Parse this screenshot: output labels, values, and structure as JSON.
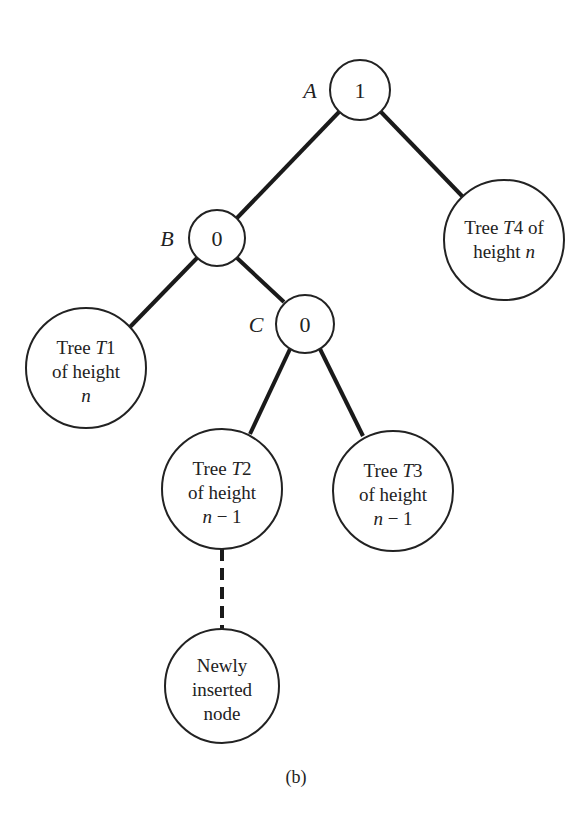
{
  "diagram": {
    "caption": "(b)",
    "nodes": {
      "A": {
        "label": "A",
        "balance": "1"
      },
      "B": {
        "label": "B",
        "balance": "0"
      },
      "C": {
        "label": "C",
        "balance": "0"
      }
    },
    "subtrees": {
      "T1": {
        "lines": [
          "Tree T1",
          "of height",
          "n"
        ],
        "name_prefix": "Tree ",
        "name_italic": "T",
        "name_suffix": "1",
        "line2": "of height",
        "line3_italic": "n"
      },
      "T2": {
        "name_prefix": "Tree ",
        "name_italic": "T",
        "name_suffix": "2",
        "line2": "of height",
        "line3_italic": "n",
        "line3_rest": " − 1"
      },
      "T3": {
        "name_prefix": "Tree ",
        "name_italic": "T",
        "name_suffix": "3",
        "line2": "of height",
        "line3_italic": "n",
        "line3_rest": " − 1"
      },
      "T4": {
        "name_prefix": "Tree ",
        "name_italic": "T",
        "name_suffix": "4 of",
        "line2_prefix": "height ",
        "line2_italic": "n"
      }
    },
    "new_node": {
      "lines": [
        "Newly",
        "inserted",
        "node"
      ]
    },
    "edges": [
      {
        "from": "A",
        "to": "B",
        "style": "solid"
      },
      {
        "from": "A",
        "to": "T4",
        "style": "solid"
      },
      {
        "from": "B",
        "to": "T1",
        "style": "solid"
      },
      {
        "from": "B",
        "to": "C",
        "style": "solid"
      },
      {
        "from": "C",
        "to": "T2",
        "style": "solid"
      },
      {
        "from": "C",
        "to": "T3",
        "style": "solid"
      },
      {
        "from": "T2",
        "to": "new_node",
        "style": "dashed"
      }
    ]
  }
}
